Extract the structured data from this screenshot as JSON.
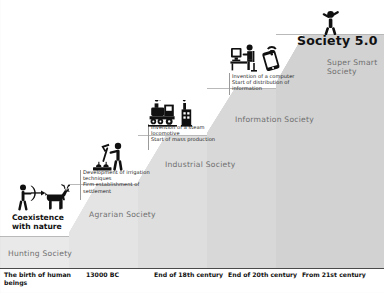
{
  "headline": "Society 5.0",
  "coexistence": {
    "line1": "Coexistence",
    "line2": "with nature"
  },
  "stages": [
    {
      "id": "hunting",
      "label": "Hunting Society"
    },
    {
      "id": "agrarian",
      "label": "Agrarian Society"
    },
    {
      "id": "industrial",
      "label": "Industrial Society"
    },
    {
      "id": "information",
      "label": "Information Society"
    },
    {
      "id": "supersmart",
      "label_line1": "Super Smart",
      "label_line2": "Society"
    }
  ],
  "annotations": [
    {
      "id": "agrarian-note",
      "lines": [
        "Development of irrigation",
        "techniques",
        "Firm establishment of",
        "settlement"
      ]
    },
    {
      "id": "industrial-note",
      "lines": [
        "Invention of a steam",
        "locomotive",
        "Start of mass production"
      ]
    },
    {
      "id": "information-note",
      "lines": [
        "Invention of a computer",
        "Start of distribution of",
        "information"
      ]
    }
  ],
  "timeline": [
    {
      "id": "t1",
      "line1": "The birth of human",
      "line2": "beings"
    },
    {
      "id": "t2",
      "line1": "13000 BC",
      "line2": ""
    },
    {
      "id": "t3",
      "line1": "End of 18th century",
      "line2": ""
    },
    {
      "id": "t4",
      "line1": "End of 20th century",
      "line2": ""
    },
    {
      "id": "t5",
      "line1": "From 21st century",
      "line2": ""
    }
  ],
  "icons": [
    {
      "id": "hunter-deer-icon",
      "stage": "hunting"
    },
    {
      "id": "farmer-crops-icon",
      "stage": "agrarian"
    },
    {
      "id": "steam-locomotive-factory-icon",
      "stage": "industrial"
    },
    {
      "id": "computer-user-mobile-icon",
      "stage": "information"
    },
    {
      "id": "celebrating-person-icon",
      "stage": "supersmart"
    }
  ],
  "colors": {
    "step_1": "#e9e9e9",
    "step_2": "#e4e4e4",
    "step_3": "#dedede",
    "step_4": "#d8d8d8",
    "step_5": "#d2d2d2",
    "label_gray": "#6f6f6f",
    "axis": "#4a4a4a",
    "icon_black": "#101010",
    "background": "#ffffff"
  }
}
